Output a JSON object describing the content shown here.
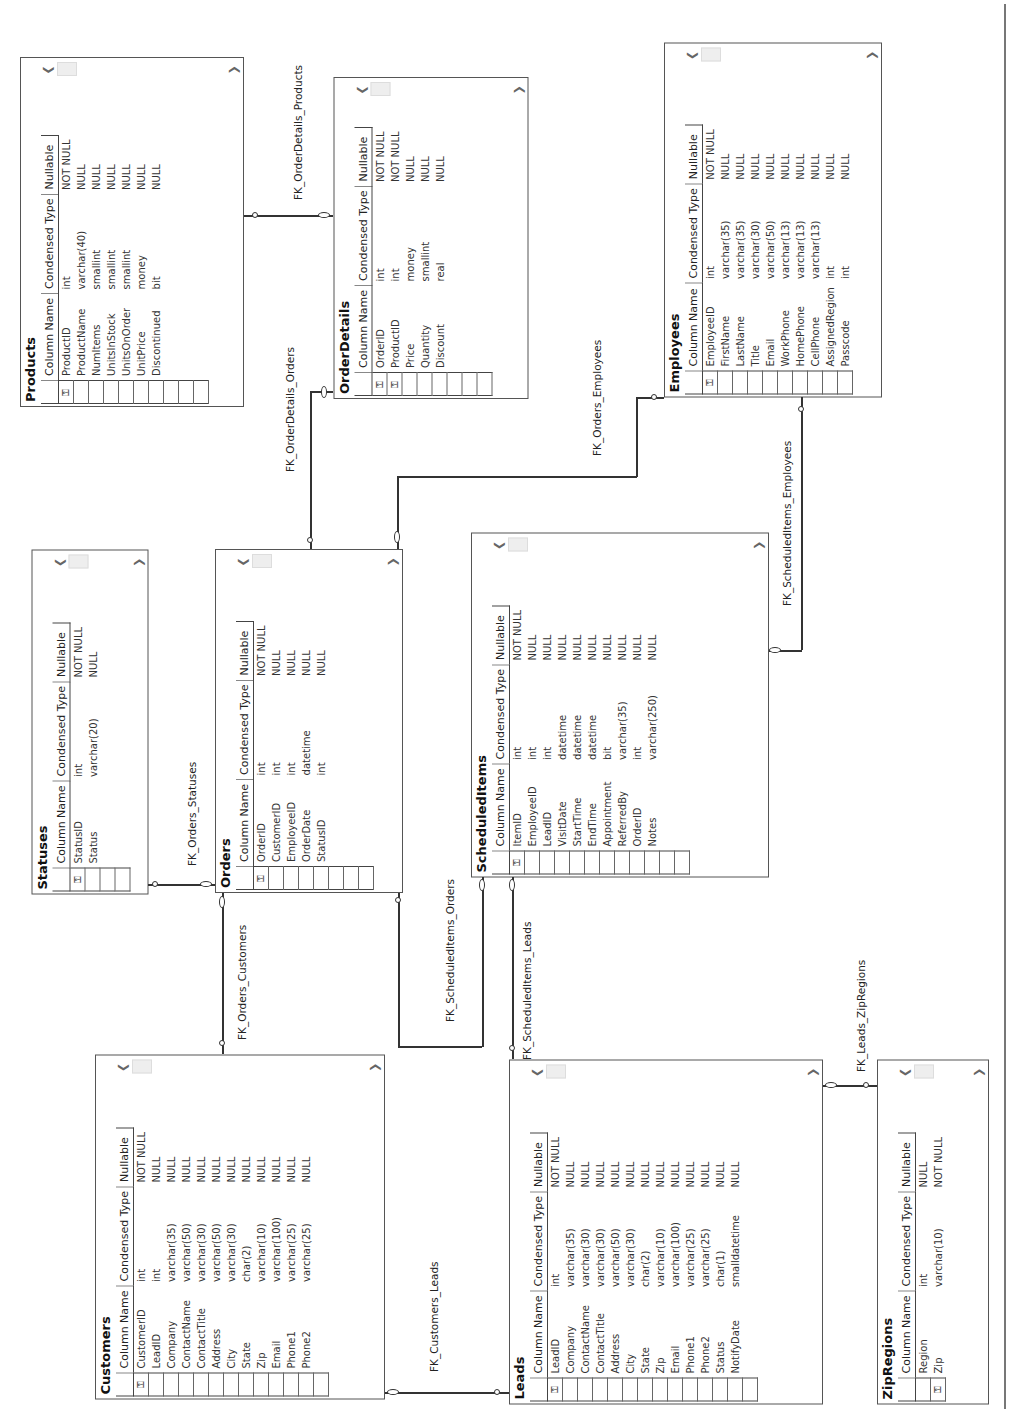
{
  "headers": {
    "column_name": "Column Name",
    "condensed_type": "Condensed Type",
    "nullable": "Nullable"
  },
  "icons": {
    "primary_key": "key-icon",
    "scroll_left": "chevron-left-icon",
    "scroll_right": "chevron-right-icon"
  },
  "tables": {
    "products": {
      "name": "Products",
      "rows": [
        {
          "pk": true,
          "col": "ProductID",
          "type": "int",
          "nullable": "NOT NULL"
        },
        {
          "pk": false,
          "col": "ProductName",
          "type": "varchar(40)",
          "nullable": "NULL"
        },
        {
          "pk": false,
          "col": "NumItems",
          "type": "smallint",
          "nullable": "NULL"
        },
        {
          "pk": false,
          "col": "UnitsInStock",
          "type": "smallint",
          "nullable": "NULL"
        },
        {
          "pk": false,
          "col": "UnitsOnOrder",
          "type": "smallint",
          "nullable": "NULL"
        },
        {
          "pk": false,
          "col": "UnitPrice",
          "type": "money",
          "nullable": "NULL"
        },
        {
          "pk": false,
          "col": "Discontinued",
          "type": "bit",
          "nullable": "NULL"
        }
      ]
    },
    "orderdetails": {
      "name": "OrderDetails",
      "rows": [
        {
          "pk": true,
          "col": "OrderID",
          "type": "int",
          "nullable": "NOT NULL"
        },
        {
          "pk": true,
          "col": "ProductID",
          "type": "int",
          "nullable": "NOT NULL"
        },
        {
          "pk": false,
          "col": "Price",
          "type": "money",
          "nullable": "NULL"
        },
        {
          "pk": false,
          "col": "Quantity",
          "type": "smallint",
          "nullable": "NULL"
        },
        {
          "pk": false,
          "col": "Discount",
          "type": "real",
          "nullable": "NULL"
        }
      ]
    },
    "employees": {
      "name": "Employees",
      "rows": [
        {
          "pk": true,
          "col": "EmployeeID",
          "type": "int",
          "nullable": "NOT NULL"
        },
        {
          "pk": false,
          "col": "FirstName",
          "type": "varchar(35)",
          "nullable": "NULL"
        },
        {
          "pk": false,
          "col": "LastName",
          "type": "varchar(35)",
          "nullable": "NULL"
        },
        {
          "pk": false,
          "col": "Title",
          "type": "varchar(30)",
          "nullable": "NULL"
        },
        {
          "pk": false,
          "col": "Email",
          "type": "varchar(50)",
          "nullable": "NULL"
        },
        {
          "pk": false,
          "col": "WorkPhone",
          "type": "varchar(13)",
          "nullable": "NULL"
        },
        {
          "pk": false,
          "col": "HomePhone",
          "type": "varchar(13)",
          "nullable": "NULL"
        },
        {
          "pk": false,
          "col": "CellPhone",
          "type": "varchar(13)",
          "nullable": "NULL"
        },
        {
          "pk": false,
          "col": "AssignedRegion",
          "type": "int",
          "nullable": "NULL"
        },
        {
          "pk": false,
          "col": "Passcode",
          "type": "int",
          "nullable": "NULL"
        }
      ]
    },
    "statuses": {
      "name": "Statuses",
      "rows": [
        {
          "pk": true,
          "col": "StatusID",
          "type": "int",
          "nullable": "NOT NULL"
        },
        {
          "pk": false,
          "col": "Status",
          "type": "varchar(20)",
          "nullable": "NULL"
        }
      ]
    },
    "orders": {
      "name": "Orders",
      "rows": [
        {
          "pk": true,
          "col": "OrderID",
          "type": "int",
          "nullable": "NOT NULL"
        },
        {
          "pk": false,
          "col": "CustomerID",
          "type": "int",
          "nullable": "NULL"
        },
        {
          "pk": false,
          "col": "EmployeeID",
          "type": "int",
          "nullable": "NULL"
        },
        {
          "pk": false,
          "col": "OrderDate",
          "type": "datetime",
          "nullable": "NULL"
        },
        {
          "pk": false,
          "col": "StatusID",
          "type": "int",
          "nullable": "NULL"
        }
      ]
    },
    "scheduleditems": {
      "name": "ScheduledItems",
      "rows": [
        {
          "pk": true,
          "col": "ItemID",
          "type": "int",
          "nullable": "NOT NULL"
        },
        {
          "pk": false,
          "col": "EmployeeID",
          "type": "int",
          "nullable": "NULL"
        },
        {
          "pk": false,
          "col": "LeadID",
          "type": "int",
          "nullable": "NULL"
        },
        {
          "pk": false,
          "col": "VisitDate",
          "type": "datetime",
          "nullable": "NULL"
        },
        {
          "pk": false,
          "col": "StartTime",
          "type": "datetime",
          "nullable": "NULL"
        },
        {
          "pk": false,
          "col": "EndTime",
          "type": "datetime",
          "nullable": "NULL"
        },
        {
          "pk": false,
          "col": "Appointment",
          "type": "bit",
          "nullable": "NULL"
        },
        {
          "pk": false,
          "col": "ReferredBy",
          "type": "varchar(35)",
          "nullable": "NULL"
        },
        {
          "pk": false,
          "col": "OrderID",
          "type": "int",
          "nullable": "NULL"
        },
        {
          "pk": false,
          "col": "Notes",
          "type": "varchar(250)",
          "nullable": "NULL"
        }
      ]
    },
    "customers": {
      "name": "Customers",
      "rows": [
        {
          "pk": true,
          "col": "CustomerID",
          "type": "int",
          "nullable": "NOT NULL"
        },
        {
          "pk": false,
          "col": "LeadID",
          "type": "int",
          "nullable": "NULL"
        },
        {
          "pk": false,
          "col": "Company",
          "type": "varchar(35)",
          "nullable": "NULL"
        },
        {
          "pk": false,
          "col": "ContactName",
          "type": "varchar(50)",
          "nullable": "NULL"
        },
        {
          "pk": false,
          "col": "ContactTitle",
          "type": "varchar(30)",
          "nullable": "NULL"
        },
        {
          "pk": false,
          "col": "Address",
          "type": "varchar(50)",
          "nullable": "NULL"
        },
        {
          "pk": false,
          "col": "City",
          "type": "varchar(30)",
          "nullable": "NULL"
        },
        {
          "pk": false,
          "col": "State",
          "type": "char(2)",
          "nullable": "NULL"
        },
        {
          "pk": false,
          "col": "Zip",
          "type": "varchar(10)",
          "nullable": "NULL"
        },
        {
          "pk": false,
          "col": "Email",
          "type": "varchar(100)",
          "nullable": "NULL"
        },
        {
          "pk": false,
          "col": "Phone1",
          "type": "varchar(25)",
          "nullable": "NULL"
        },
        {
          "pk": false,
          "col": "Phone2",
          "type": "varchar(25)",
          "nullable": "NULL"
        }
      ]
    },
    "leads": {
      "name": "Leads",
      "rows": [
        {
          "pk": true,
          "col": "LeadID",
          "type": "int",
          "nullable": "NOT NULL"
        },
        {
          "pk": false,
          "col": "Company",
          "type": "varchar(35)",
          "nullable": "NULL"
        },
        {
          "pk": false,
          "col": "ContactName",
          "type": "varchar(30)",
          "nullable": "NULL"
        },
        {
          "pk": false,
          "col": "ContactTitle",
          "type": "varchar(30)",
          "nullable": "NULL"
        },
        {
          "pk": false,
          "col": "Address",
          "type": "varchar(50)",
          "nullable": "NULL"
        },
        {
          "pk": false,
          "col": "City",
          "type": "varchar(30)",
          "nullable": "NULL"
        },
        {
          "pk": false,
          "col": "State",
          "type": "char(2)",
          "nullable": "NULL"
        },
        {
          "pk": false,
          "col": "Zip",
          "type": "varchar(10)",
          "nullable": "NULL"
        },
        {
          "pk": false,
          "col": "Email",
          "type": "varchar(100)",
          "nullable": "NULL"
        },
        {
          "pk": false,
          "col": "Phone1",
          "type": "varchar(25)",
          "nullable": "NULL"
        },
        {
          "pk": false,
          "col": "Phone2",
          "type": "varchar(25)",
          "nullable": "NULL"
        },
        {
          "pk": false,
          "col": "Status",
          "type": "char(1)",
          "nullable": "NULL"
        },
        {
          "pk": false,
          "col": "NotifyDate",
          "type": "smalldatetime",
          "nullable": "NULL"
        }
      ]
    },
    "zipregions": {
      "name": "ZipRegions",
      "rows": [
        {
          "pk": false,
          "col": "Region",
          "type": "int",
          "nullable": "NULL"
        },
        {
          "pk": true,
          "col": "Zip",
          "type": "varchar(10)",
          "nullable": "NOT NULL"
        }
      ]
    }
  },
  "relationships": {
    "fk_orderdetails_products": "FK_OrderDetails_Products",
    "fk_orderdetails_orders": "FK_OrderDetails_Orders",
    "fk_orders_employees": "FK_Orders_Employees",
    "fk_scheduleditems_employees": "FK_ScheduledItems_Employees",
    "fk_orders_statuses": "FK_Orders_Statuses",
    "fk_orders_customers": "FK_Orders_Customers",
    "fk_scheduleditems_orders": "FK_ScheduledItems_Orders",
    "fk_scheduleditems_leads": "FK_ScheduledItems_Leads",
    "fk_customers_leads": "FK_Customers_Leads",
    "fk_leads_zipregions": "FK_Leads_ZipRegions"
  }
}
